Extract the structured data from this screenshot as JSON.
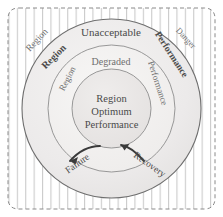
{
  "diagram": {
    "background_color": "#ffffff",
    "boundary": {
      "name": "dashed-rounded-rectangle",
      "stroke": "#8a8a8a",
      "dash": "4 3"
    },
    "hatch": {
      "name": "vertical-hatch-fill",
      "stroke": "#b9b9b9",
      "spacing_px": 8
    },
    "rings": [
      {
        "id": "danger",
        "label": "Danger",
        "fill": "#ffffff",
        "stroke": "#8a8a8a",
        "hatched": true
      },
      {
        "id": "unacceptable",
        "label": "Unacceptable",
        "fill": "#eceaea",
        "stroke": "#6e6e6e"
      },
      {
        "id": "degraded",
        "label": "Degraded",
        "fill": "#f1f0ef",
        "stroke": "#8a8a8a"
      },
      {
        "id": "optimum",
        "label": "Region Optimum Performance",
        "fill": "#e9e7e6",
        "stroke": "#8a8a8a"
      }
    ],
    "labels": {
      "outer_ring_top": "Unacceptable",
      "middle_ring_top": "Degraded",
      "center_line1": "Region",
      "center_line2": "Optimum",
      "center_line3": "Performance",
      "hatch_region_left": "Region",
      "hatch_region_right": "Danger",
      "outer_region_left": "Region",
      "outer_performance_right": "Performance",
      "middle_region_left": "Region",
      "middle_performance_right": "Performance",
      "arrow_left": "Failure",
      "arrow_right": "Recovery"
    },
    "arrows": [
      {
        "id": "failure-arrow",
        "label": "Failure",
        "direction": "down-left",
        "color": "#3a3a3a"
      },
      {
        "id": "recovery-arrow",
        "label": "Recovery",
        "direction": "up-right",
        "color": "#3a3a3a"
      }
    ]
  }
}
